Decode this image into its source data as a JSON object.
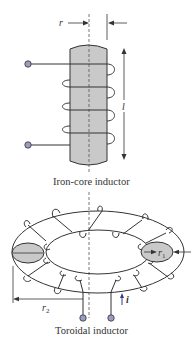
{
  "figure": {
    "iron_core": {
      "caption": "Iron-core inductor",
      "radius_label": "r",
      "length_label": "l",
      "turns": 4
    },
    "toroid": {
      "caption": "Toroidal inductor",
      "minor_radius_label": "r",
      "minor_radius_sub": "1",
      "major_radius_label": "r",
      "major_radius_sub": "2",
      "current_label": "i"
    },
    "colors": {
      "core_fill": "#c9c9c9",
      "wire": "#333333",
      "terminal_fill": "#9a9cc4",
      "dashed_axis": "#555555"
    }
  }
}
